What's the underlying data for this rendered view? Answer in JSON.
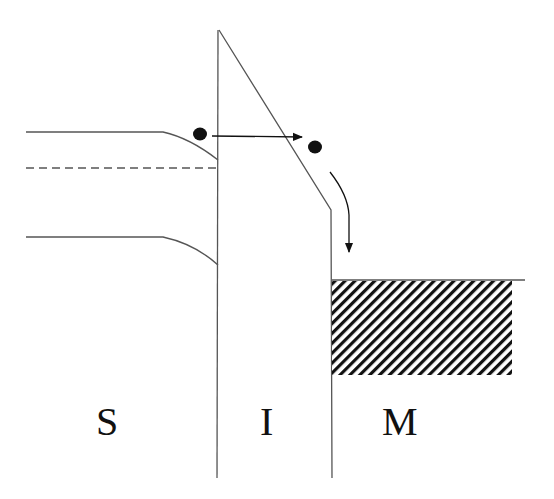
{
  "diagram": {
    "type": "band-diagram",
    "regions": [
      {
        "id": "semiconductor",
        "label": "S"
      },
      {
        "id": "insulator",
        "label": "I"
      },
      {
        "id": "metal",
        "label": "M"
      }
    ],
    "elements": {
      "conduction_band": "semiconductor conduction band bending down at interface",
      "fermi_level": "dashed line in semiconductor",
      "valence_band": "semiconductor valence band bending down at interface",
      "insulator_barrier": "triangular barrier",
      "metal_filled_states": "hatched region below metal Fermi level",
      "electron_tunneling_arrow": "electron tunnels horizontally through barrier",
      "electron_relax_arrow": "electron relaxes down into metal"
    },
    "colors": {
      "line": "#555555",
      "electron": "#111111",
      "hatch": "#111111"
    }
  }
}
